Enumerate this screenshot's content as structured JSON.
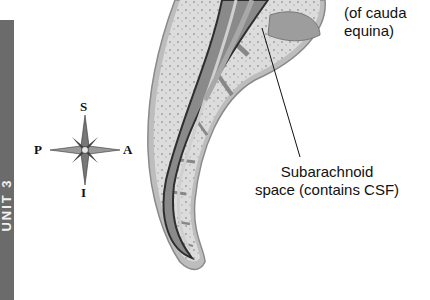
{
  "sidebar_tab": {
    "label": "UNIT 3"
  },
  "compass": {
    "superior": "S",
    "inferior": "I",
    "posterior": "P",
    "anterior": "A"
  },
  "labels": {
    "cauda_equina": {
      "line1": "(of cauda",
      "line2": "equina)"
    },
    "subarachnoid": {
      "line1": "Subarachnoid",
      "line2": "space (contains CSF)"
    }
  },
  "colors": {
    "bar": "#6b6b6b",
    "bone": "#d9d9d9",
    "canal": "#8a8a8a",
    "outline": "#3a3a3a"
  }
}
